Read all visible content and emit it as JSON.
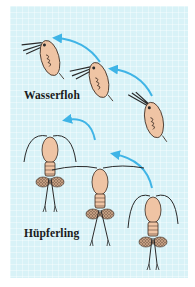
{
  "figure": {
    "background_color": "#d8f2f7",
    "arrow_color": "#3fb4e6",
    "body_color": "#efc4a4",
    "outline_color": "#3a2a20"
  },
  "labels": {
    "daphnia": "Wasserfloh",
    "copepod": "Hüpferling"
  },
  "groups": [
    {
      "name": "Wasserfloh",
      "organism_count": 3,
      "arrow_count": 2
    },
    {
      "name": "Hüpferling",
      "organism_count": 3,
      "arrow_count": 2
    }
  ]
}
